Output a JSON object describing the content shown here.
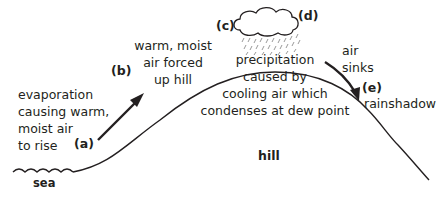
{
  "diagram": {
    "type": "relief-rainfall",
    "labels": {
      "a": "(a)",
      "b": "(b)",
      "c": "(c)",
      "d": "(d)",
      "e": "(e)"
    },
    "text": {
      "evaporation_1": "evaporation",
      "evaporation_2": "causing warm,",
      "evaporation_3": "moist air",
      "evaporation_4": "to rise",
      "forced_1": "warm, moist",
      "forced_2": "air forced",
      "forced_3": "up hill",
      "precip_1": "precipitation",
      "precip_2": "caused by",
      "precip_3": "cooling air which",
      "precip_4": "condenses at dew point",
      "sinks_1": "air",
      "sinks_2": "sinks",
      "rainshadow": "rainshadow",
      "hill": "hill",
      "sea": "sea"
    },
    "colors": {
      "line": "#231f20",
      "rain": "#9a9a9a",
      "background": "#ffffff"
    }
  }
}
